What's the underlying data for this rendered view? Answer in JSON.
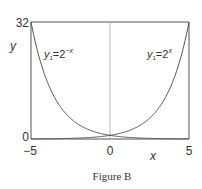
{
  "chart_data": {
    "type": "line",
    "title": "",
    "caption": "Figure B",
    "xlabel": "x",
    "ylabel": "y",
    "xlim": [
      -5,
      5
    ],
    "ylim": [
      0,
      32
    ],
    "x_ticks": [
      "-5",
      "0",
      "5"
    ],
    "y_ticks": [
      "0",
      "32"
    ],
    "grid": false,
    "legend": "inline curve labels",
    "series": [
      {
        "name": "y1=2^-x",
        "label_main": "y",
        "label_sub": "1",
        "label_eq": "=2",
        "label_sup": "−x",
        "x": [
          -5,
          -4,
          -3,
          -2,
          -1,
          0,
          1,
          2,
          3,
          4,
          5
        ],
        "values": [
          32,
          16,
          8,
          4,
          2,
          1,
          0.5,
          0.25,
          0.125,
          0.0625,
          0.03125
        ]
      },
      {
        "name": "y1=2^x",
        "label_main": "y",
        "label_sub": "1",
        "label_eq": "=2",
        "label_sup": "x",
        "x": [
          -5,
          -4,
          -3,
          -2,
          -1,
          0,
          1,
          2,
          3,
          4,
          5
        ],
        "values": [
          0.03125,
          0.0625,
          0.125,
          0.25,
          0.5,
          1,
          2,
          4,
          8,
          16,
          32
        ]
      }
    ]
  },
  "labels": {
    "y_top": "32",
    "y_bottom": "0",
    "x_left": "−5",
    "x_mid": "0",
    "x_right": "5",
    "x_axis": "x",
    "y_axis": "y",
    "caption": "Figure B"
  }
}
